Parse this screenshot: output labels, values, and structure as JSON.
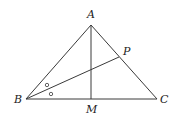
{
  "diagram": {
    "type": "geometry-triangle",
    "points": {
      "A": {
        "label": "A",
        "x": 91,
        "y": 25
      },
      "B": {
        "label": "B",
        "x": 26,
        "y": 99
      },
      "C": {
        "label": "C",
        "x": 157,
        "y": 99
      },
      "M": {
        "label": "M",
        "x": 91,
        "y": 99
      },
      "P": {
        "label": "P",
        "x": 119,
        "y": 57
      }
    },
    "segments": [
      "AB",
      "BC",
      "CA",
      "AM",
      "BP"
    ],
    "annotations": {
      "equal_angle_marks": "small circles indicating BP bisects angle ABC",
      "mark_symbol": "o"
    }
  }
}
